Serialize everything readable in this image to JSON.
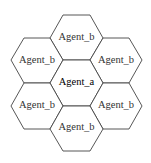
{
  "diagram": {
    "type": "hexagonal-neighborhood",
    "center_cell": {
      "label": "Agent_a"
    },
    "neighbor_cells": [
      {
        "position": "top",
        "label": "Agent_b"
      },
      {
        "position": "upper-left",
        "label": "Agent_b"
      },
      {
        "position": "upper-right",
        "label": "Agent_b"
      },
      {
        "position": "lower-left",
        "label": "Agent_b"
      },
      {
        "position": "lower-right",
        "label": "Agent_b"
      },
      {
        "position": "bottom",
        "label": "Agent_b"
      }
    ]
  }
}
